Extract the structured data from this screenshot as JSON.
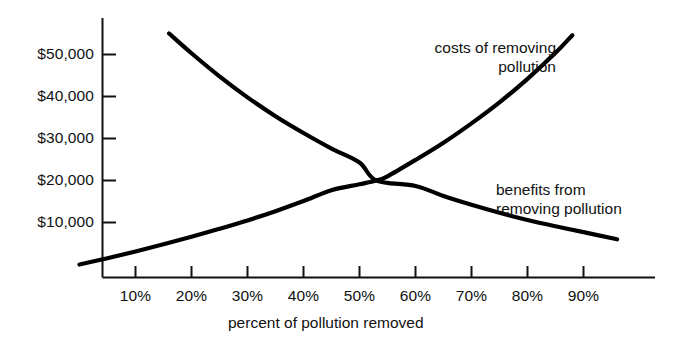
{
  "chart_data": {
    "type": "line",
    "title": "",
    "subtitle": "",
    "xlabel": "percent of pollution removed",
    "ylabel": "",
    "xlim": [
      0,
      99
    ],
    "ylim": [
      0,
      60000
    ],
    "grid": false,
    "legend_position": "inline-annotations",
    "x_tick_labels": [
      "10%",
      "20%",
      "30%",
      "40%",
      "50%",
      "60%",
      "70%",
      "80%",
      "90%"
    ],
    "x_tick_values": [
      10,
      20,
      30,
      40,
      50,
      60,
      70,
      80,
      90
    ],
    "y_tick_labels": [
      "$10,000",
      "$20,000",
      "$30,000",
      "$40,000",
      "$50,000"
    ],
    "y_tick_values": [
      10000,
      20000,
      30000,
      40000,
      50000
    ],
    "annotations": [
      {
        "name": "costs-label",
        "line1": "costs of removing",
        "line2": "pollution"
      },
      {
        "name": "benefits-label",
        "line1": "benefits from",
        "line2": "removing pollution"
      }
    ],
    "intersection": {
      "x": 53,
      "y": 20000
    },
    "series": [
      {
        "name": "costs of removing pollution",
        "color": "#000000",
        "x": [
          0,
          5,
          10,
          15,
          20,
          25,
          30,
          35,
          40,
          45,
          50,
          53,
          55,
          60,
          65,
          70,
          75,
          80,
          85,
          88
        ],
        "values": [
          0,
          1500,
          3100,
          4800,
          6600,
          8500,
          10500,
          12700,
          15100,
          17700,
          19100,
          20000,
          21000,
          24900,
          29000,
          33600,
          38600,
          44200,
          50400,
          54600
        ]
      },
      {
        "name": "benefits from removing pollution",
        "color": "#000000",
        "x": [
          16,
          20,
          25,
          30,
          35,
          40,
          45,
          50,
          53,
          55,
          60,
          65,
          70,
          75,
          80,
          85,
          90,
          96
        ],
        "values": [
          55000,
          50300,
          44800,
          39800,
          35300,
          31300,
          27600,
          24300,
          20000,
          21300,
          18700,
          16300,
          14200,
          12300,
          10600,
          9100,
          7700,
          6000
        ]
      }
    ]
  }
}
